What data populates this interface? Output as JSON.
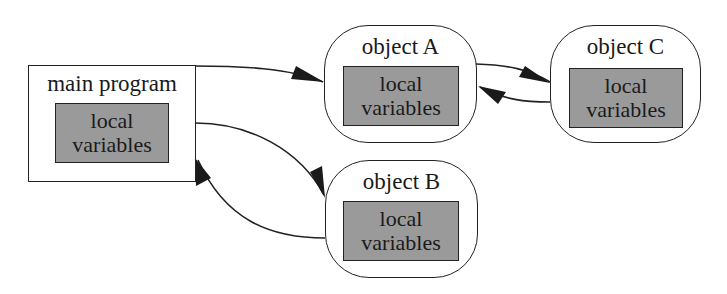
{
  "diagram": {
    "type": "object-communication-diagram",
    "nodes": [
      {
        "id": "main",
        "label": "main program",
        "shape": "rectangle",
        "inner": {
          "line1": "local",
          "line2": "variables"
        }
      },
      {
        "id": "objA",
        "label": "object A",
        "shape": "rounded",
        "inner": {
          "line1": "local",
          "line2": "variables"
        }
      },
      {
        "id": "objB",
        "label": "object B",
        "shape": "rounded",
        "inner": {
          "line1": "local",
          "line2": "variables"
        }
      },
      {
        "id": "objC",
        "label": "object C",
        "shape": "rounded",
        "inner": {
          "line1": "local",
          "line2": "variables"
        }
      }
    ],
    "edges": [
      {
        "from": "main",
        "to": "objA"
      },
      {
        "from": "main",
        "to": "objB"
      },
      {
        "from": "objB",
        "to": "main"
      },
      {
        "from": "objA",
        "to": "objC"
      },
      {
        "from": "objC",
        "to": "objA"
      }
    ],
    "colors": {
      "inner_fill": "#9a9a9a",
      "stroke": "#222222",
      "background": "#ffffff"
    }
  }
}
